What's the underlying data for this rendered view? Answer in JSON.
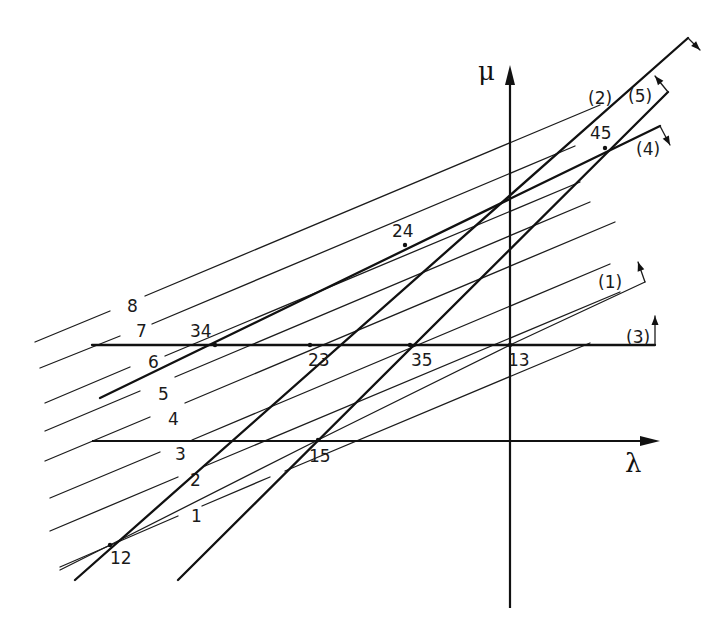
{
  "diagram": {
    "axes": {
      "mu": {
        "label": "μ",
        "x": 510,
        "y_top": 65,
        "y_bottom": 608,
        "label_pos": [
          478,
          80
        ]
      },
      "lambda": {
        "label": "λ",
        "y": 441,
        "x_left": 92,
        "x_right": 660,
        "label_pos": [
          625,
          472
        ]
      }
    },
    "parallel_lines": {
      "slope": -0.42,
      "items": [
        {
          "label": "1",
          "segments": [
            [
              60,
              567,
              178,
              516
            ],
            [
              202,
              506,
              270,
              477
            ],
            [
              285,
              471,
              590,
              343
            ]
          ],
          "label_pos": [
            191,
            522
          ]
        },
        {
          "label": "2",
          "segments": [
            [
              50,
              531,
              178,
              477
            ],
            [
              205,
              466,
              620,
              292
            ]
          ],
          "label_pos": [
            190,
            486
          ]
        },
        {
          "label": "3",
          "segments": [
            [
              50,
              498,
              160,
              452
            ],
            [
              192,
              440,
              610,
              264
            ]
          ],
          "label_pos": [
            175,
            460
          ]
        },
        {
          "label": "4",
          "segments": [
            [
              45,
              461,
              150,
              417
            ],
            [
              185,
              403,
              615,
              222
            ]
          ],
          "label_pos": [
            168,
            425
          ]
        },
        {
          "label": "5",
          "segments": [
            [
              45,
              431,
              140,
              391
            ],
            [
              175,
              377,
              590,
              202
            ]
          ],
          "label_pos": [
            158,
            400
          ]
        },
        {
          "label": "6",
          "segments": [
            [
              45,
              403,
              130,
              367
            ],
            [
              165,
              356,
              580,
              182
            ]
          ],
          "label_pos": [
            148,
            368
          ]
        },
        {
          "label": "7",
          "segments": [
            [
              40,
              368,
              120,
              336
            ],
            [
              152,
              324,
              575,
              146
            ]
          ],
          "label_pos": [
            136,
            337
          ]
        },
        {
          "label": "8",
          "segments": [
            [
              35,
              342,
              110,
              311
            ],
            [
              145,
              296,
              600,
              105
            ]
          ],
          "label_pos": [
            127,
            312
          ]
        }
      ]
    },
    "constraint_lines": [
      {
        "label": "(1)",
        "kind": "thin",
        "points": [
          [
            60,
            570
          ],
          [
            110,
            545
          ],
          [
            318,
            440
          ],
          [
            510,
            345
          ],
          [
            645,
            282
          ]
        ],
        "arrow": [
          [
            645,
            282
          ],
          [
            638,
            262
          ]
        ],
        "label_pos": [
          598,
          288
        ]
      },
      {
        "label": "(2)",
        "kind": "thick",
        "points": [
          [
            75,
            580
          ],
          [
            688,
            38
          ]
        ],
        "arrow": [
          [
            688,
            38
          ],
          [
            700,
            50
          ]
        ],
        "label_pos": [
          588,
          104
        ]
      },
      {
        "label": "(3)",
        "kind": "thick",
        "points": [
          [
            92,
            345
          ],
          [
            655,
            345
          ]
        ],
        "arrow": [
          [
            655,
            345
          ],
          [
            655,
            316
          ]
        ],
        "label_pos": [
          626,
          343
        ]
      },
      {
        "label": "(4)",
        "kind": "thick",
        "points": [
          [
            100,
            398
          ],
          [
            660,
            126
          ]
        ],
        "arrow": [
          [
            660,
            126
          ],
          [
            670,
            145
          ]
        ],
        "label_pos": [
          636,
          155
        ]
      },
      {
        "label": "(5)",
        "kind": "thick",
        "points": [
          [
            178,
            580
          ],
          [
            668,
            92
          ]
        ],
        "arrow": [
          [
            668,
            92
          ],
          [
            655,
            76
          ]
        ],
        "label_pos": [
          628,
          102
        ]
      }
    ],
    "vertices": [
      {
        "label": "12",
        "x": 110,
        "y": 545,
        "label_pos": [
          110,
          564
        ]
      },
      {
        "label": "15",
        "x": 318,
        "y": 440,
        "label_pos": [
          309,
          462
        ]
      },
      {
        "label": "13",
        "x": 510,
        "y": 345,
        "label_pos": [
          508,
          366
        ]
      },
      {
        "label": "34",
        "x": 215,
        "y": 345,
        "label_pos": [
          190,
          337
        ]
      },
      {
        "label": "23",
        "x": 310,
        "y": 345,
        "label_pos": [
          308,
          366
        ]
      },
      {
        "label": "35",
        "x": 410,
        "y": 345,
        "label_pos": [
          411,
          366
        ]
      },
      {
        "label": "24",
        "x": 405,
        "y": 245,
        "label_pos": [
          392,
          237
        ]
      },
      {
        "label": "45",
        "x": 605,
        "y": 148,
        "label_pos": [
          590,
          139
        ]
      }
    ]
  }
}
